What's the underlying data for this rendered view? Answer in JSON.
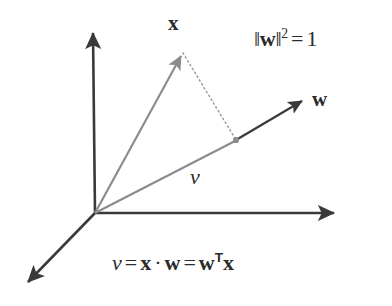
{
  "figure": {
    "background_color": "#ffffff",
    "axis_color": "#3a3a3a",
    "vector_gray_color": "#8c8c8c",
    "vector_dark_color": "#3a3a3a",
    "dotted_color": "#9a9a9a",
    "text_color": "#2b2b2b"
  },
  "labels": {
    "x_vector": "x",
    "w_vector": "w",
    "v_scalar": "v"
  },
  "annotations": {
    "norm_constraint": {
      "norm_open": "‖",
      "norm_symbol": "w",
      "norm_close": "‖",
      "exponent": "2",
      "equals": "=",
      "value": "1",
      "full_text": "‖w‖² = 1"
    },
    "dot_product_equation": {
      "lhs": "v",
      "equals_1": "=",
      "term_x": "x",
      "dot": "·",
      "term_w": "w",
      "equals_2": "=",
      "term_wT": "w",
      "transpose": "T",
      "term_x2": "x",
      "full_text": "v = x · w = wᵀx"
    }
  },
  "geometry": {
    "origin": {
      "x": 95,
      "y": 213
    },
    "axes": [
      {
        "name": "y-axis-vertical",
        "from": [
          95,
          213
        ],
        "to": [
          93,
          30
        ]
      },
      {
        "name": "x-axis-horizontal",
        "from": [
          95,
          213
        ],
        "to": [
          338,
          213
        ]
      },
      {
        "name": "z-axis-diagonal",
        "from": [
          95,
          213
        ],
        "to": [
          24,
          286
        ]
      }
    ],
    "vectors": [
      {
        "name": "x-vector",
        "from": [
          95,
          213
        ],
        "to": [
          183,
          52
        ],
        "color": "#8c8c8c",
        "style": "solid-arrow"
      },
      {
        "name": "v-projection-vector",
        "from": [
          95,
          213
        ],
        "to": [
          236,
          140
        ],
        "color": "#8c8c8c",
        "style": "solid"
      },
      {
        "name": "w-vector",
        "from": [
          236,
          140
        ],
        "to": [
          306,
          99
        ],
        "color": "#3a3a3a",
        "style": "solid-arrow"
      },
      {
        "name": "perpendicular-dotted",
        "from": [
          183,
          52
        ],
        "to": [
          236,
          140
        ],
        "color": "#9a9a9a",
        "style": "dotted"
      }
    ],
    "projection_point": {
      "x": 236,
      "y": 140
    }
  }
}
